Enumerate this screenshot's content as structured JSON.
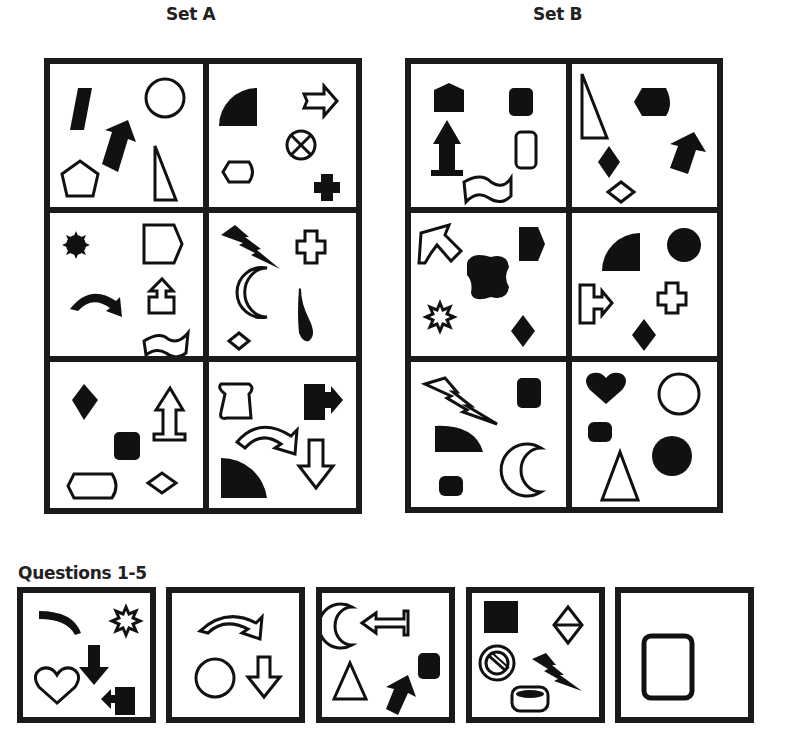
{
  "set_a": {
    "title": "Set A",
    "cells": [
      {
        "id": "a1",
        "shapes": [
          "black-parallelogram",
          "black-arrow-up-right",
          "outline-circle",
          "outline-pentagon",
          "outline-right-triangle"
        ]
      },
      {
        "id": "a2",
        "shapes": [
          "black-quarter-circle",
          "outline-arrow-right",
          "outline-circle-cross",
          "outline-hexagon",
          "black-cross"
        ]
      },
      {
        "id": "a3",
        "shapes": [
          "black-starburst",
          "outline-pentagon-arrow",
          "black-curved-arrow",
          "outline-arrow-up-box",
          "outline-wave-banner"
        ]
      },
      {
        "id": "a4",
        "shapes": [
          "black-lightning",
          "outline-cross",
          "outline-crescent",
          "black-teardrop",
          "outline-diamond"
        ]
      },
      {
        "id": "a5",
        "shapes": [
          "black-diamond",
          "outline-arrow-up-base",
          "black-rounded-square",
          "outline-hexagon",
          "outline-diamond"
        ]
      },
      {
        "id": "a6",
        "shapes": [
          "outline-scroll",
          "black-square-arrow-right",
          "outline-curved-arrow",
          "outline-arrow-down",
          "black-quarter-circle"
        ]
      }
    ]
  },
  "set_b": {
    "title": "Set B",
    "cells": [
      {
        "id": "b1",
        "shapes": [
          "black-house-pentagon",
          "black-rounded-square",
          "black-arrow-up-base",
          "outline-rounded-rect",
          "outline-wave-banner"
        ]
      },
      {
        "id": "b2",
        "shapes": [
          "outline-right-triangle",
          "black-hexagon",
          "black-arrow-up-right",
          "black-diamond",
          "outline-diamond"
        ]
      },
      {
        "id": "b3",
        "shapes": [
          "outline-arrow-up-left",
          "black-pentagon-arrow",
          "black-blob",
          "outline-starburst",
          "black-diamond"
        ]
      },
      {
        "id": "b4",
        "shapes": [
          "black-quarter-circle",
          "black-circle",
          "outline-box-arrow-right",
          "outline-cross",
          "black-diamond"
        ]
      },
      {
        "id": "b5",
        "shapes": [
          "outline-lightning",
          "black-rounded-square",
          "black-quarter-circle",
          "outline-crescent",
          "black-cylinder"
        ]
      },
      {
        "id": "b6",
        "shapes": [
          "black-heart",
          "outline-circle",
          "black-cylinder",
          "black-circle",
          "outline-triangle"
        ]
      }
    ]
  },
  "questions": {
    "title": "Questions 1-5",
    "items": [
      {
        "number": 1,
        "shapes": [
          "black-arc",
          "outline-starburst",
          "black-arrow-down",
          "outline-heart",
          "black-square-arrow-left"
        ]
      },
      {
        "number": 2,
        "shapes": [
          "outline-curved-arrow",
          "outline-circle",
          "outline-arrow-down"
        ]
      },
      {
        "number": 3,
        "shapes": [
          "outline-crescent",
          "outline-arrow-left-bar",
          "outline-triangle",
          "black-rounded-square",
          "black-arrow-up-right"
        ]
      },
      {
        "number": 4,
        "shapes": [
          "black-square",
          "outline-split-diamond",
          "outline-no-symbol",
          "black-lightning",
          "outline-cylinder"
        ]
      },
      {
        "number": 5,
        "shapes": [
          "outline-rounded-rect"
        ]
      }
    ]
  }
}
